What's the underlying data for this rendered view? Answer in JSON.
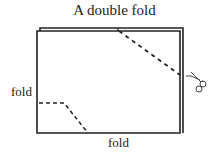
{
  "title": "A double fold",
  "labels": {
    "fold_left": "fold",
    "fold_bottom": "fold"
  },
  "icons": {
    "scissors": "scissors-icon"
  },
  "colors": {
    "line": "#222222",
    "background": "#ffffff"
  }
}
